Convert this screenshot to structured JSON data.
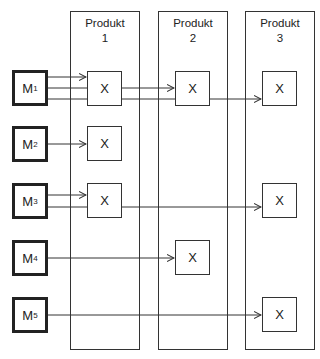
{
  "products": [
    {
      "title": "Produkt",
      "number": "1"
    },
    {
      "title": "Produkt",
      "number": "2"
    },
    {
      "title": "Produkt",
      "number": "3"
    }
  ],
  "machines": [
    {
      "label": "M",
      "sub": "1",
      "targets": [
        1,
        2,
        3
      ]
    },
    {
      "label": "M",
      "sub": "2",
      "targets": [
        1
      ]
    },
    {
      "label": "M",
      "sub": "3",
      "targets": [
        1,
        3
      ]
    },
    {
      "label": "M",
      "sub": "4",
      "targets": [
        2
      ]
    },
    {
      "label": "M",
      "sub": "5",
      "targets": [
        3
      ]
    }
  ],
  "mark": "X",
  "cells": [
    {
      "machine": 1,
      "product": 1,
      "mark": "X"
    },
    {
      "machine": 1,
      "product": 2,
      "mark": "X"
    },
    {
      "machine": 1,
      "product": 3,
      "mark": "X"
    },
    {
      "machine": 2,
      "product": 1,
      "mark": "X"
    },
    {
      "machine": 3,
      "product": 1,
      "mark": "X"
    },
    {
      "machine": 3,
      "product": 3,
      "mark": "X"
    },
    {
      "machine": 4,
      "product": 2,
      "mark": "X"
    },
    {
      "machine": 5,
      "product": 3,
      "mark": "X"
    }
  ]
}
